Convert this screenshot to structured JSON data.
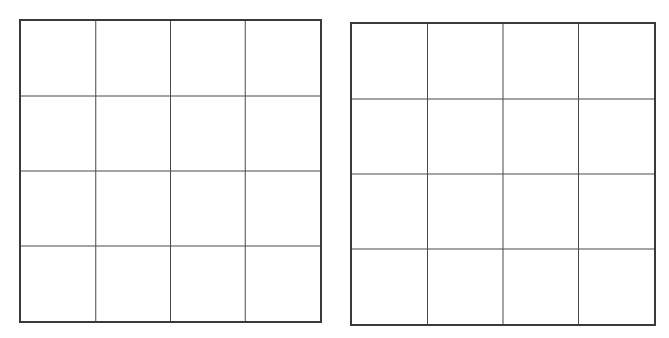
{
  "diagram": {
    "type": "grid-pair",
    "grids": [
      {
        "id": "left",
        "rows": 4,
        "columns": 4,
        "cells_filled": [],
        "line_color": "#3a3a3a",
        "background": "#ffffff"
      },
      {
        "id": "right",
        "rows": 4,
        "columns": 4,
        "cells_filled": [],
        "line_color": "#3a3a3a",
        "background": "#ffffff"
      }
    ]
  }
}
